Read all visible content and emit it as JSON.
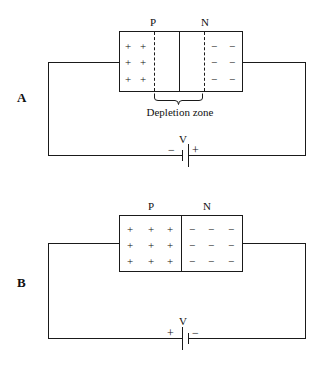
{
  "figure": {
    "panels": [
      {
        "id": "A",
        "label": "A",
        "junction_labels": {
          "p": "P",
          "n": "N"
        },
        "annotation": "Depletion zone",
        "charge_symbols": {
          "positive": "+",
          "negative": "−"
        },
        "p_region": {
          "columns": 2,
          "rows": 3,
          "symbol": "+",
          "cells": [
            [
              "+",
              "+"
            ],
            [
              "+",
              "+"
            ],
            [
              "+",
              "+"
            ]
          ]
        },
        "n_region": {
          "columns": 2,
          "rows": 3,
          "symbol": "−",
          "cells": [
            [
              "−",
              "−"
            ],
            [
              "−",
              "−"
            ],
            [
              "−",
              "−"
            ]
          ]
        },
        "depletion_zone": {
          "visible": true,
          "label": "Depletion zone"
        },
        "battery": {
          "label": "V",
          "left_terminal": "−",
          "right_terminal": "+",
          "bias": "reverse"
        }
      },
      {
        "id": "B",
        "label": "B",
        "junction_labels": {
          "p": "P",
          "n": "N"
        },
        "annotation": "",
        "charge_symbols": {
          "positive": "+",
          "negative": "−"
        },
        "p_region": {
          "columns": 3,
          "rows": 3,
          "symbol": "+",
          "cells": [
            [
              "+",
              "+",
              "+"
            ],
            [
              "+",
              "+",
              "+"
            ],
            [
              "+",
              "+",
              "+"
            ]
          ]
        },
        "n_region": {
          "columns": 3,
          "rows": 3,
          "symbol": "−",
          "cells": [
            [
              "−",
              "−",
              "−"
            ],
            [
              "−",
              "−",
              "−"
            ],
            [
              "−",
              "−",
              "−"
            ]
          ]
        },
        "depletion_zone": {
          "visible": false,
          "label": ""
        },
        "battery": {
          "label": "V",
          "left_terminal": "+",
          "right_terminal": "−",
          "bias": "forward"
        }
      }
    ],
    "colors": {
      "ink": "#1a1a1a",
      "background": "#ffffff"
    }
  }
}
